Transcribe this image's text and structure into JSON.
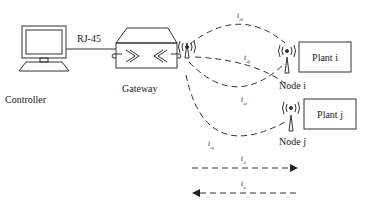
{
  "labels": {
    "controller": "Controller",
    "gateway": "Gateway",
    "link": "RJ-45",
    "node_i": "Node i",
    "node_j": "Node j",
    "plant_i": "Plant i",
    "plant_j": "Plant j"
  },
  "delays": {
    "t_di": {
      "base": "t",
      "sub": "di"
    },
    "t_dj": {
      "base": "t",
      "sub": "dj"
    },
    "t_ui": {
      "base": "t",
      "sub": "ui"
    },
    "t_uj": {
      "base": "t",
      "sub": "uj"
    },
    "t_d": {
      "base": "t",
      "sub": "d"
    },
    "t_u": {
      "base": "t",
      "sub": "u"
    }
  },
  "legend": [
    {
      "label": "t_d",
      "direction": "right"
    },
    {
      "label": "t_u",
      "direction": "left"
    }
  ]
}
